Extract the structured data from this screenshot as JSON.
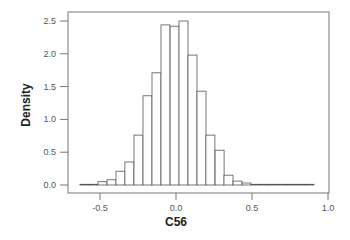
{
  "chart_data": {
    "type": "bar",
    "subtype": "histogram",
    "title": "",
    "xlabel": "C56",
    "ylabel": "Density",
    "xlim": [
      -0.7,
      1.0
    ],
    "ylim": [
      0,
      2.6
    ],
    "xticks": [
      -0.5,
      0.0,
      0.5,
      1.0
    ],
    "xtick_labels": [
      "-0.5",
      "0.0",
      "0.5",
      "1.0"
    ],
    "yticks": [
      0.0,
      0.5,
      1.0,
      1.5,
      2.0,
      2.5
    ],
    "ytick_labels": [
      "0.0",
      "0.5",
      "1.0",
      "1.5",
      "2.0",
      "2.5"
    ],
    "grid": false,
    "legend": null,
    "bin_width": 0.059,
    "bin_left_edges": [
      -0.632,
      -0.573,
      -0.514,
      -0.454,
      -0.395,
      -0.336,
      -0.276,
      -0.217,
      -0.158,
      -0.099,
      -0.039,
      0.02,
      0.079,
      0.138,
      0.197,
      0.257,
      0.316,
      0.375,
      0.434,
      0.493,
      0.553,
      0.612,
      0.671,
      0.73,
      0.789,
      0.849
    ],
    "values": [
      0.01,
      0.01,
      0.05,
      0.08,
      0.21,
      0.35,
      0.76,
      1.36,
      1.71,
      2.44,
      2.42,
      2.5,
      1.98,
      1.43,
      0.76,
      0.53,
      0.15,
      0.06,
      0.03,
      0.01,
      0.01,
      0.01,
      0.01,
      0.01,
      0.01,
      0.01
    ]
  }
}
